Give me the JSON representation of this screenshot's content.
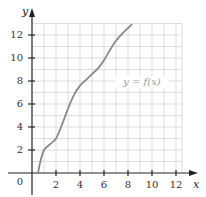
{
  "chart_data": {
    "type": "line",
    "title": "",
    "xlabel": "x",
    "ylabel": "y",
    "xlim": [
      0,
      12.5
    ],
    "ylim": [
      0,
      13
    ],
    "grid": true,
    "grid_step": 1,
    "x_ticks": [
      2,
      4,
      6,
      8,
      10,
      12
    ],
    "y_ticks": [
      2,
      4,
      6,
      8,
      10,
      12
    ],
    "origin_label": "0",
    "series": [
      {
        "name": "y = f(x)",
        "x": [
          0.5,
          0.7,
          1.0,
          1.5,
          2.0,
          2.5,
          3.0,
          3.5,
          4.0,
          4.5,
          5.0,
          5.5,
          6.0,
          6.5,
          7.0,
          7.5,
          8.0,
          8.3
        ],
        "y": [
          0.0,
          1.0,
          2.0,
          2.5,
          3.0,
          4.2,
          5.6,
          6.8,
          7.6,
          8.1,
          8.6,
          9.1,
          9.8,
          10.7,
          11.5,
          12.1,
          12.6,
          12.9
        ]
      }
    ],
    "annotations": [
      {
        "text": "y = f(x)",
        "x": 5.6,
        "y": 7.7
      }
    ],
    "legend": "none"
  },
  "labels": {
    "x_axis": "x",
    "y_axis": "y",
    "origin": "0",
    "curve": "y = f(x)",
    "xt": [
      "2",
      "4",
      "6",
      "8",
      "10",
      "12"
    ],
    "yt": [
      "2",
      "4",
      "6",
      "8",
      "10",
      "12"
    ]
  },
  "colors": {
    "grid": "#d4d4d4",
    "axis": "#222222",
    "curve": "#888888",
    "text": "#333333"
  }
}
